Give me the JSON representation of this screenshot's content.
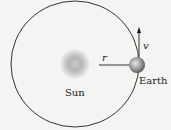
{
  "diagram": {
    "sun_label": "Sun",
    "earth_label": "Earth",
    "radius_label": "r",
    "velocity_label": "v"
  }
}
